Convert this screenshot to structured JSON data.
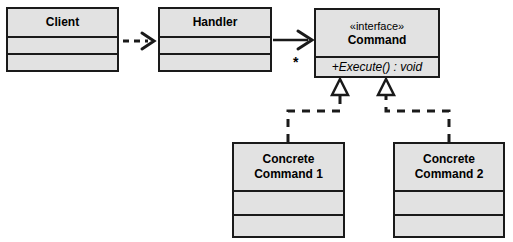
{
  "diagram": {
    "background_color": "#ffffff",
    "box_fill_color": "#e2e2e2",
    "line_color": "#1a1a1a"
  },
  "classes": {
    "client": {
      "name": "Client",
      "compartments": [
        "",
        ""
      ]
    },
    "handler": {
      "name": "Handler",
      "compartments": [
        "",
        ""
      ]
    },
    "command": {
      "stereotype": "«interface»",
      "name": "Command",
      "operation": "+Execute() : void"
    },
    "concrete_command_1": {
      "name_line_1": "Concrete",
      "name_line_2": "Command 1",
      "compartments": [
        "",
        ""
      ]
    },
    "concrete_command_2": {
      "name_line_1": "Concrete",
      "name_line_2": "Command 2",
      "compartments": [
        "",
        ""
      ]
    }
  },
  "relationships": {
    "client_to_handler": {
      "type": "dependency",
      "style": "dashed",
      "arrowhead": "open",
      "label": ""
    },
    "handler_to_command": {
      "type": "association",
      "style": "solid",
      "arrowhead": "open",
      "multiplicity": "*"
    },
    "concrete_command_1_to_command": {
      "type": "realization",
      "style": "dashed",
      "arrowhead": "hollow-triangle"
    },
    "concrete_command_2_to_command": {
      "type": "realization",
      "style": "dashed",
      "arrowhead": "hollow-triangle"
    }
  }
}
